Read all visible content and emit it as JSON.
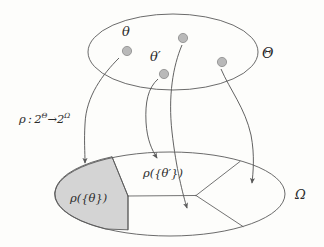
{
  "figure": {
    "colors": {
      "stroke": "#5a5a5a",
      "dot_fill": "#b9b9b9",
      "dot_stroke": "#8a8a8a",
      "shaded_fill": "#d4d4d4",
      "background": "#fdfdfb",
      "text": "#2b2b2b"
    },
    "labels": {
      "theta": "θ",
      "theta_prime": "θ′",
      "big_theta": "Θ",
      "omega": "Ω",
      "rho_map_prefix": "ρ : 2",
      "rho_map_sup1": "Θ",
      "rho_map_arrow": "→",
      "rho_map_base2": "2",
      "rho_map_sup2": "Ω",
      "rho_map_full": "ρ : 2Θ→2Ω",
      "rho_singleton_theta": "ρ({θ})",
      "rho_singleton_theta_prime": "ρ({θ′})"
    },
    "top_set": {
      "name": "Theta",
      "ellipse": {
        "cx": 173,
        "cy": 52,
        "rx": 85,
        "ry": 38
      },
      "points": [
        {
          "id": "theta",
          "cx": 127,
          "cy": 51,
          "r": 4.6,
          "label": "θ"
        },
        {
          "id": "theta-prime",
          "cx": 164,
          "cy": 74,
          "r": 4.6,
          "label": "θ′"
        },
        {
          "id": "point-3",
          "cx": 183,
          "cy": 38,
          "r": 4.6,
          "label": ""
        },
        {
          "id": "point-4",
          "cx": 222,
          "cy": 62,
          "r": 4.6,
          "label": ""
        }
      ]
    },
    "bottom_set": {
      "name": "Omega",
      "ellipse": {
        "cx": 170,
        "cy": 194,
        "rx": 115,
        "ry": 42
      },
      "regions": [
        {
          "id": "region-rho-theta",
          "shaded": true,
          "label": "ρ({θ})"
        },
        {
          "id": "region-rho-theta-prime",
          "shaded": false,
          "label": "ρ({θ′})"
        },
        {
          "id": "region-lower-middle",
          "shaded": false,
          "label": ""
        },
        {
          "id": "region-right-upper",
          "shaded": false,
          "label": ""
        },
        {
          "id": "region-right-lower",
          "shaded": false,
          "label": ""
        }
      ]
    },
    "arrows": [
      {
        "id": "arrow-theta-to-rho-theta",
        "from": "theta",
        "to": "region-rho-theta"
      },
      {
        "id": "arrow-theta-prime-to-rho-theta-prime",
        "from": "theta-prime",
        "to": "region-rho-theta-prime"
      },
      {
        "id": "arrow-point3-to-lower-middle",
        "from": "point-3",
        "to": "region-lower-middle"
      },
      {
        "id": "arrow-point4-to-right-region",
        "from": "point-4",
        "to": "region-right-upper"
      }
    ]
  }
}
